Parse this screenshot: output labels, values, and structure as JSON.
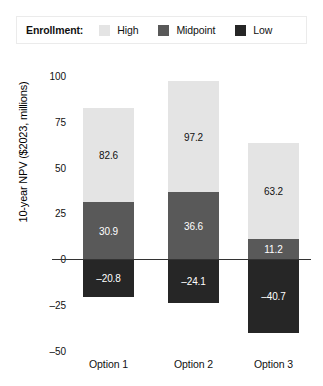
{
  "legend": {
    "title": "Enrollment:",
    "entries": [
      {
        "label": "High",
        "swatch_color": "#e4e4e4",
        "icon": "legend-swatch-high"
      },
      {
        "label": "Midpoint",
        "swatch_color": "#595959",
        "icon": "legend-swatch-midpoint"
      },
      {
        "label": "Low",
        "swatch_color": "#262626",
        "icon": "legend-swatch-low"
      }
    ],
    "border_color": "#ebebeb"
  },
  "chart_data": {
    "type": "bar",
    "title": "",
    "subtitle": "",
    "xlabel": "",
    "ylabel": "10-year NPV ($2023, millions)",
    "categories": [
      "Option 1",
      "Option 2",
      "Option 3"
    ],
    "series": [
      {
        "name": "High",
        "color": "#e4e4e4",
        "values": [
          82.6,
          97.2,
          63.2
        ],
        "label_color": "#111111"
      },
      {
        "name": "Midpoint",
        "color": "#595959",
        "values": [
          30.9,
          36.6,
          11.2
        ],
        "label_color": "#ffffff"
      },
      {
        "name": "Low",
        "color": "#262626",
        "values": [
          -20.8,
          -24.1,
          -40.7
        ],
        "label_color": "#ffffff"
      }
    ],
    "data_labels": {
      "Option 1": {
        "High": "82.6",
        "Midpoint": "30.9",
        "Low": "–20.8"
      },
      "Option 2": {
        "High": "97.2",
        "Midpoint": "36.6",
        "Low": "–24.1"
      },
      "Option 3": {
        "High": "63.2",
        "Midpoint": "11.2",
        "Low": "–40.7"
      }
    },
    "yticks": [
      {
        "value": 100,
        "label": "100"
      },
      {
        "value": 75,
        "label": "75"
      },
      {
        "value": 50,
        "label": "50"
      },
      {
        "value": 25,
        "label": "25"
      },
      {
        "value": 0,
        "label": "0"
      },
      {
        "value": -25,
        "label": "–25"
      },
      {
        "value": -50,
        "label": "–50"
      }
    ],
    "ylim": [
      -50,
      100
    ],
    "grid": false,
    "legend_position": "top",
    "bar_mode": "overlaid-from-zero",
    "zero_line_color": "#333333"
  }
}
